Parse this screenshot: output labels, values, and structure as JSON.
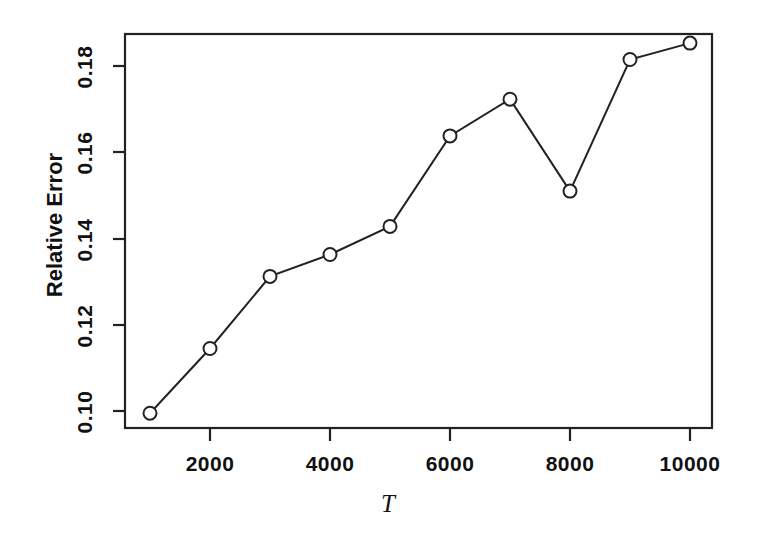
{
  "chart_data": {
    "type": "line",
    "title": "",
    "subtitle": "",
    "xlabel": "T",
    "ylabel": "Relative Error",
    "x": [
      1000,
      2000,
      3000,
      4000,
      5000,
      6000,
      7000,
      8000,
      9000,
      10000
    ],
    "values": [
      0.0995,
      0.1145,
      0.1312,
      0.1363,
      0.1428,
      0.1638,
      0.1723,
      0.151,
      0.1815,
      0.1853
    ],
    "series": [
      {
        "name": "Relative Error",
        "values": [
          0.0995,
          0.1145,
          0.1312,
          0.1363,
          0.1428,
          0.1638,
          0.1723,
          0.151,
          0.1815,
          0.1853
        ]
      }
    ],
    "xlim": [
      650,
      10450
    ],
    "ylim": [
      0.0935,
      0.1885
    ],
    "xticks": [
      2000,
      4000,
      6000,
      8000,
      10000
    ],
    "xtick_labels": [
      "2000",
      "4000",
      "6000",
      "8000",
      "10000"
    ],
    "yticks": [
      0.1,
      0.12,
      0.14,
      0.16,
      0.18
    ],
    "ytick_labels": [
      "0.10",
      "0.12",
      "0.14",
      "0.16",
      "0.18"
    ],
    "grid": false,
    "legend": null,
    "marker": "open-circle",
    "line_color": "#222222",
    "marker_color": "#222222",
    "background": "#ffffff"
  },
  "axes": {
    "x_title": "T",
    "y_title": "Relative Error"
  }
}
